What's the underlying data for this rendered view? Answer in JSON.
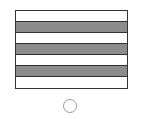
{
  "figure": {
    "stripes": [
      {
        "color": "#ffffff"
      },
      {
        "color": "#8c8c8c"
      },
      {
        "color": "#ffffff"
      },
      {
        "color": "#8c8c8c"
      },
      {
        "color": "#ffffff"
      },
      {
        "color": "#8c8c8c"
      },
      {
        "color": "#ffffff"
      }
    ],
    "border_color": "#333333"
  },
  "option": {
    "selected": false
  }
}
